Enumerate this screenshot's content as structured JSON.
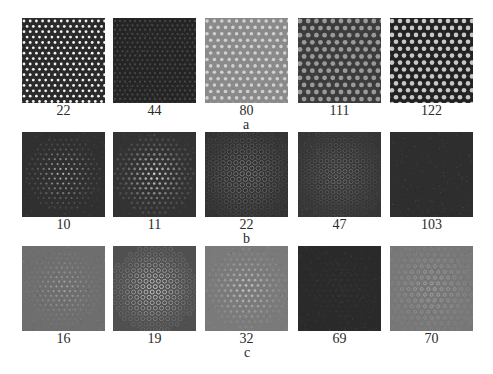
{
  "figure": {
    "rows": [
      {
        "label": "a",
        "panels": [
          {
            "caption": "22",
            "bg": "#2a2a2a",
            "dot": "#f2f2f2",
            "pattern": "dots",
            "spacing": 6.2,
            "r": 1.4,
            "extent": 1.0,
            "rot": 0
          },
          {
            "caption": "44",
            "bg": "#252525",
            "dot": "#4a4a4a",
            "pattern": "dots",
            "spacing": 5.0,
            "r": 1.1,
            "extent": 1.0,
            "rot": 0
          },
          {
            "caption": "80",
            "bg": "#8a8a8a",
            "dot": "#d0d0d0",
            "pattern": "dots",
            "spacing": 7.4,
            "r": 1.8,
            "extent": 1.0,
            "rot": 0
          },
          {
            "caption": "111",
            "bg": "#3c3c3c",
            "dot": "#9a9a9a",
            "pattern": "dots",
            "spacing": 8.2,
            "r": 2.4,
            "extent": 1.0,
            "rot": 0
          },
          {
            "caption": "122",
            "bg": "#222222",
            "dot": "#c8c8c8",
            "pattern": "dots",
            "spacing": 8.0,
            "r": 2.3,
            "extent": 1.0,
            "rot": 0
          }
        ]
      },
      {
        "label": "b",
        "panels": [
          {
            "caption": "10",
            "bg": "#303030",
            "dot": "#c0c0c0",
            "pattern": "dots",
            "spacing": 5.6,
            "r": 1.1,
            "extent": 0.38,
            "rot": 0
          },
          {
            "caption": "11",
            "bg": "#333333",
            "dot": "#d4d4d4",
            "pattern": "dots",
            "spacing": 5.6,
            "r": 1.3,
            "extent": 0.4,
            "rot": 0
          },
          {
            "caption": "22",
            "bg": "#333333",
            "dot": "#8a8a8a",
            "pattern": "rings",
            "spacing": 6.4,
            "r": 2.2,
            "extent": 0.5,
            "rot": 0
          },
          {
            "caption": "47",
            "bg": "#363636",
            "dot": "#7a7a7a",
            "pattern": "rings",
            "spacing": 6.0,
            "r": 2.0,
            "extent": 0.48,
            "rot": 0
          },
          {
            "caption": "103",
            "bg": "#2e2e2e",
            "dot": "#3e3e3e",
            "pattern": "noise",
            "spacing": 5.0,
            "r": 1.0,
            "extent": 0.0,
            "rot": 0
          }
        ]
      },
      {
        "label": "c",
        "panels": [
          {
            "caption": "16",
            "bg": "#6e6e6e",
            "dot": "#a8a8a8",
            "pattern": "dots",
            "spacing": 5.4,
            "r": 1.1,
            "extent": 0.38,
            "rot": 0
          },
          {
            "caption": "19",
            "bg": "#505050",
            "dot": "#dcdcdc",
            "pattern": "rings",
            "spacing": 6.2,
            "r": 2.0,
            "extent": 0.44,
            "rot": 0
          },
          {
            "caption": "32",
            "bg": "#7a7a7a",
            "dot": "#c4c4c4",
            "pattern": "dots",
            "spacing": 6.0,
            "r": 1.4,
            "extent": 0.4,
            "rot": 0
          },
          {
            "caption": "69",
            "bg": "#2a2a2a",
            "dot": "#3a3a3a",
            "pattern": "hex",
            "spacing": 6.0,
            "r": 1.0,
            "extent": 0.45,
            "rot": 0
          },
          {
            "caption": "70",
            "bg": "#777777",
            "dot": "#b0b0b0",
            "pattern": "hex",
            "spacing": 6.6,
            "r": 1.5,
            "extent": 0.5,
            "rot": 0
          }
        ]
      }
    ]
  }
}
